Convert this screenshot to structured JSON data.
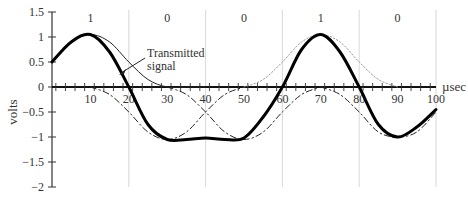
{
  "chart_data": {
    "type": "line",
    "title": "",
    "xlabel": "µsec",
    "ylabel": "volts",
    "xlim": [
      0,
      100
    ],
    "ylim": [
      -2,
      1.5
    ],
    "x_ticks": [
      10,
      20,
      30,
      40,
      50,
      60,
      70,
      80,
      90,
      100
    ],
    "x_tick_labels": [
      "10",
      "20",
      "30",
      "40",
      "50",
      "60",
      "70",
      "80",
      "90",
      "100"
    ],
    "y_ticks": [
      1.5,
      1,
      0.5,
      0,
      -0.5,
      -1,
      -1.5,
      -2
    ],
    "y_tick_labels": [
      "1.5",
      "1",
      "0.5",
      "0",
      "−0.5",
      "−1",
      "−1.5",
      "−2"
    ],
    "vertical_gridlines": [
      20,
      40,
      60,
      80,
      100
    ],
    "bits": [
      {
        "label": "1",
        "center": 10
      },
      {
        "label": "0",
        "center": 30
      },
      {
        "label": "0",
        "center": 50
      },
      {
        "label": "1",
        "center": 70
      },
      {
        "label": "0",
        "center": 90
      }
    ],
    "annotation": {
      "text_line1": "Transmitted",
      "text_line2": "signal",
      "x": 20,
      "y": 0.6
    },
    "series": [
      {
        "name": "Transmitted signal (sum)",
        "style": "thick-solid",
        "x": [
          0,
          5,
          10,
          15,
          20,
          25,
          30,
          35,
          40,
          45,
          50,
          55,
          60,
          65,
          70,
          75,
          80,
          85,
          90,
          95,
          100
        ],
        "values": [
          0.5,
          0.9,
          1.05,
          0.7,
          0.0,
          -0.75,
          -1.05,
          -1.05,
          -1.02,
          -1.05,
          -1.02,
          -0.6,
          0.0,
          0.75,
          1.05,
          0.7,
          0.0,
          -0.75,
          -1.0,
          -0.8,
          -0.45
        ]
      },
      {
        "name": "Pulse bit 1 (t=10)",
        "style": "thin-solid",
        "x": [
          0,
          5,
          10,
          15,
          20,
          25,
          30,
          35,
          40
        ],
        "values": [
          0.5,
          0.9,
          1.05,
          0.9,
          0.5,
          0.15,
          0.0,
          0.0,
          0.0
        ]
      },
      {
        "name": "Pulse bit 0 (t=30)",
        "style": "dash-dot",
        "x": [
          10,
          15,
          20,
          25,
          30,
          35,
          40,
          45,
          50
        ],
        "values": [
          0.0,
          -0.15,
          -0.5,
          -0.9,
          -1.05,
          -0.9,
          -0.5,
          -0.15,
          0.0
        ]
      },
      {
        "name": "Pulse bit 0 (t=50)",
        "style": "dash-dot",
        "x": [
          30,
          35,
          40,
          45,
          50,
          55,
          60,
          65,
          70
        ],
        "values": [
          0.0,
          -0.15,
          -0.5,
          -0.9,
          -1.05,
          -0.9,
          -0.5,
          -0.15,
          0.0
        ]
      },
      {
        "name": "Pulse bit 1 (t=70)",
        "style": "dotted",
        "x": [
          50,
          55,
          60,
          65,
          70,
          75,
          80,
          85,
          90
        ],
        "values": [
          0.0,
          0.15,
          0.5,
          0.9,
          1.05,
          0.9,
          0.5,
          0.15,
          0.0
        ]
      },
      {
        "name": "Pulse bit 0 (t=90)",
        "style": "dash-dot",
        "x": [
          70,
          75,
          80,
          85,
          90,
          95,
          100
        ],
        "values": [
          0.0,
          -0.15,
          -0.5,
          -0.9,
          -1.0,
          -0.9,
          -0.5
        ]
      }
    ],
    "grid": false,
    "legend": "none"
  }
}
